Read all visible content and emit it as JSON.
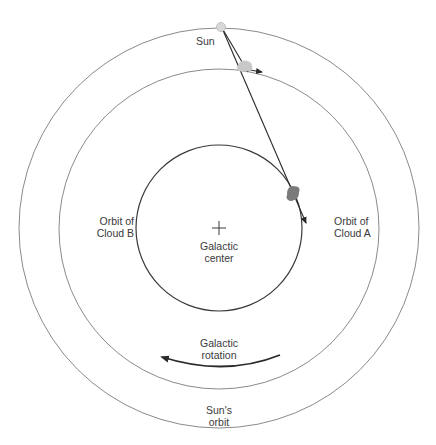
{
  "diagram": {
    "colors": {
      "background": "#ffffff",
      "sun_orbit": "#8a8a8a",
      "cloud_a_orbit": "#8a8a8a",
      "cloud_b_orbit": "#3a3a3a",
      "sightline": "#2a2a2a",
      "sun_fill": "#d9d9d9",
      "cloud_a_fill": "#c8c8c8",
      "cloud_b_fill": "#7a7a7a",
      "text": "#3a3a3a"
    },
    "labels": {
      "sun": "Sun",
      "galactic_center_line1": "Galactic",
      "galactic_center_line2": "center",
      "orbit_cloud_b_line1": "Orbit of",
      "orbit_cloud_b_line2": "Cloud B",
      "orbit_cloud_a_line1": "Orbit of",
      "orbit_cloud_a_line2": "Cloud A",
      "rotation_line1": "Galactic",
      "rotation_line2": "rotation",
      "sun_orbit_line1": "Sun's",
      "sun_orbit_line2": "orbit"
    }
  }
}
